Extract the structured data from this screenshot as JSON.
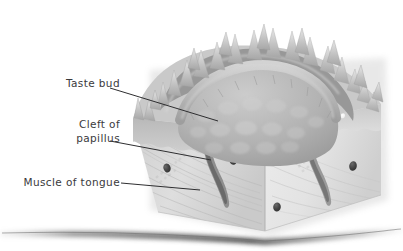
{
  "figure": {
    "background_color": "#ffffff",
    "label_color": "#3a3a3c",
    "leader_line_color": "#2e2e30",
    "palette": {
      "epithelium_light": "#e2e2e2",
      "epithelium_mid": "#c6c6c6",
      "epithelium_dark": "#9e9e9e",
      "papilla_dome": "#b4b4b4",
      "muscle_face_left": "#dadada",
      "muscle_face_right": "#e6e6e6",
      "cleft_dark": "#6f6f6f",
      "taste_bud": "#f4f4f4",
      "duct_dark": "#4a4a4a",
      "ground_shadow": "#8d8d8d"
    }
  },
  "labels": [
    {
      "id": "taste-bud",
      "text": "Taste bud",
      "lines": [
        "Taste bud"
      ]
    },
    {
      "id": "cleft-of-papillus",
      "text": "Cleft of papillus",
      "lines": [
        "Cleft of",
        "papillus"
      ]
    },
    {
      "id": "muscle-of-tongue",
      "text": "Muscle of tongue",
      "lines": [
        "Muscle of tongue"
      ]
    }
  ],
  "label_text": {
    "taste_bud": "Taste bud",
    "cleft_line1": "Cleft of",
    "cleft_line2": "papillus",
    "muscle_of_tongue": "Muscle of tongue"
  },
  "structures": [
    {
      "name": "filiform-papillae",
      "description": "spiky conical projections along the top surface"
    },
    {
      "name": "circumvallate-papilla-dome",
      "description": "central domed papilla with cobblestone surface"
    },
    {
      "name": "circular-trench",
      "description": "furrow encircling the papilla"
    },
    {
      "name": "taste-buds",
      "description": "pale oval bodies in the trench walls"
    },
    {
      "name": "cleft-of-papillus",
      "description": "deep cleft descending into the tissue"
    },
    {
      "name": "muscle-of-tongue",
      "description": "striated muscle body of the block"
    },
    {
      "name": "gland-ducts",
      "description": "dark oval duct openings in the cut faces"
    },
    {
      "name": "ground-shadow",
      "description": "horizontal cast shadow under the block"
    }
  ]
}
